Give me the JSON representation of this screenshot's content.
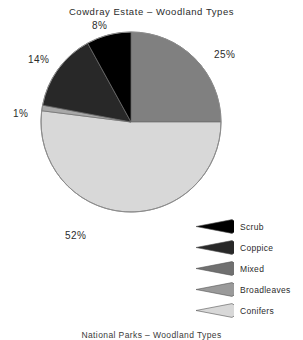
{
  "chart_data": {
    "type": "pie",
    "title": "Cowdray Estate – Woodland Types",
    "caption": "National Parks – Woodland Types",
    "categories": [
      "Scrub",
      "Coppice",
      "Mixed",
      "Broadleaves",
      "Conifers"
    ],
    "values": [
      8,
      14,
      25,
      1,
      52
    ],
    "value_labels": [
      "8%",
      "14%",
      "25%",
      "1%",
      "52%"
    ],
    "colors": [
      "#000000",
      "#282828",
      "#808080",
      "#a8a8a8",
      "#d8d8d8"
    ],
    "units": "percent",
    "legend_position": "bottom-right",
    "grid": false,
    "start_angle_deg": 0,
    "direction": "clockwise",
    "slice_order_clockwise_from_top": [
      "Mixed",
      "Conifers",
      "Broadleaves",
      "Coppice",
      "Scrub"
    ],
    "slices": [
      {
        "label": "Mixed",
        "value": 25,
        "value_label": "25%",
        "color": "#808080"
      },
      {
        "label": "Conifers",
        "value": 52,
        "value_label": "52%",
        "color": "#d8d8d8"
      },
      {
        "label": "Broadleaves",
        "value": 1,
        "value_label": "1%",
        "color": "#a8a8a8"
      },
      {
        "label": "Coppice",
        "value": 14,
        "value_label": "14%",
        "color": "#282828"
      },
      {
        "label": "Scrub",
        "value": 8,
        "value_label": "8%",
        "color": "#000000"
      }
    ]
  },
  "title": "Cowdray Estate – Woodland Types",
  "caption": "National Parks – Woodland Types",
  "labels": {
    "mixed": "25%",
    "conifers": "52%",
    "broadleaves": "1%",
    "coppice": "14%",
    "scrub": "8%"
  },
  "legend": {
    "items": [
      {
        "label": "Scrub",
        "color": "#000000"
      },
      {
        "label": "Coppice",
        "color": "#282828"
      },
      {
        "label": "Mixed",
        "color": "#707070"
      },
      {
        "label": "Broadleaves",
        "color": "#9a9a9a"
      },
      {
        "label": "Conifers",
        "color": "#d8d8d8"
      }
    ]
  }
}
